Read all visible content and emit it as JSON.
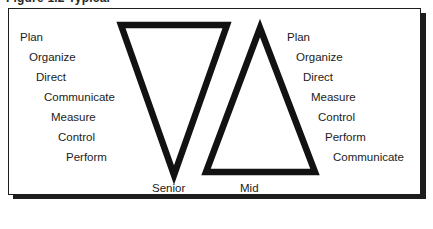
{
  "figure": {
    "caption": "Figure 1.2  Typical",
    "frame_border_color": "#1d1d1d",
    "background_color": "#ffffff",
    "shadow_color": "#1d1d1d"
  },
  "shapes": {
    "stroke_color": "#121212",
    "senior": {
      "name": "inverted-triangle",
      "label": "Senior",
      "points": "121,25 227,25 174,175"
    },
    "mid": {
      "name": "upright-triangle",
      "label": "Mid",
      "points": "260,28 315,172 206,172"
    }
  },
  "ladders": {
    "left": {
      "name": "senior-function-ladder",
      "items": [
        "Plan",
        "Organize",
        "Direct",
        "Communicate",
        "Measure",
        "Control",
        "Perform"
      ]
    },
    "right": {
      "name": "mid-function-ladder",
      "items": [
        "Plan",
        "Organize",
        "Direct",
        "Measure",
        "Control",
        "Perform",
        "Communicate"
      ]
    }
  }
}
